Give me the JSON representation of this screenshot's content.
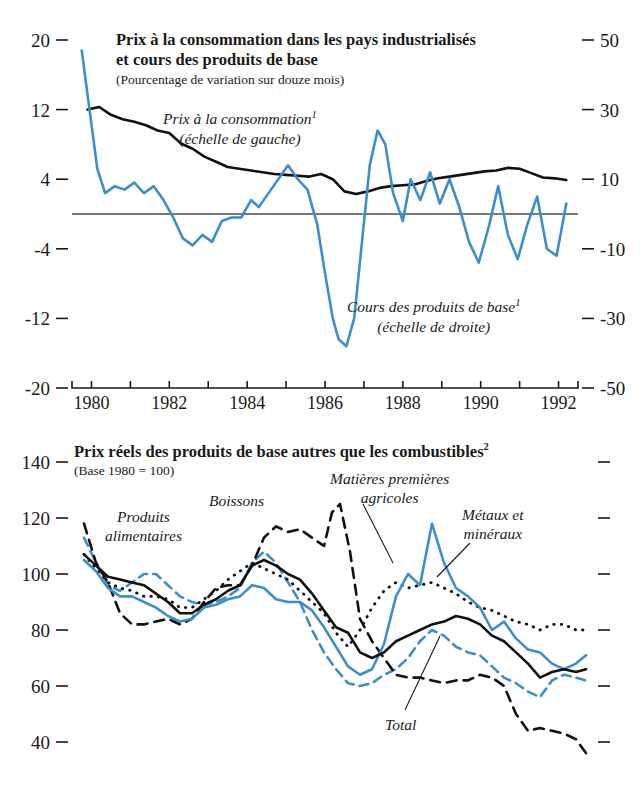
{
  "figure": {
    "language": "fr",
    "accent_blue": "#3d8fc9",
    "ink_black": "#111111"
  },
  "chart_data": [
    {
      "id": "top",
      "type": "line",
      "title": "Prix à la consommation dans les pays industrialisés et cours des produits de base",
      "title_line1": "Prix à la consommation dans les pays industrialisés",
      "title_line2": "et cours des produits de base",
      "subtitle": "(Pourcentage de variation sur douze mois)",
      "xlabel": "",
      "ylabel": "",
      "xlim": [
        1979.5,
        1992.5
      ],
      "xticks": [
        1980,
        1981,
        1982,
        1983,
        1984,
        1985,
        1986,
        1987,
        1988,
        1989,
        1990,
        1991,
        1992
      ],
      "xticklabels": [
        "1980",
        "",
        "1982",
        "",
        "1984",
        "",
        "1986",
        "",
        "1988",
        "",
        "1990",
        "",
        "1992"
      ],
      "left_axis": {
        "label": "échelle de gauche",
        "ylim": [
          -20,
          20
        ],
        "yticks": [
          20,
          12,
          4,
          -4,
          -12,
          -20
        ],
        "yticklabels": [
          "20",
          "12",
          "4",
          "-4",
          "-12",
          "-20"
        ]
      },
      "right_axis": {
        "label": "échelle de droite",
        "ylim": [
          -50,
          50
        ],
        "yticks": [
          50,
          30,
          10,
          -10,
          -30,
          -50
        ],
        "yticklabels": [
          "50",
          "30",
          "10",
          "-10",
          "-30",
          "-50"
        ]
      },
      "grid": false,
      "zero_line": true,
      "legend_position": "inline-annotations",
      "series": [
        {
          "name": "Prix à la consommation",
          "footnote_marker": "1",
          "axis": "left",
          "style": "solid",
          "color": "#111111",
          "label_line1": "Prix à la consommation",
          "label_line2": "(échelle de gauche)",
          "x": [
            1979.9,
            1980.2,
            1980.5,
            1980.8,
            1981.1,
            1981.4,
            1981.7,
            1982.0,
            1982.3,
            1982.6,
            1982.9,
            1983.2,
            1983.5,
            1983.8,
            1984.1,
            1984.4,
            1984.7,
            1985.0,
            1985.3,
            1985.6,
            1985.9,
            1986.2,
            1986.5,
            1986.8,
            1987.1,
            1987.4,
            1987.7,
            1988.0,
            1988.3,
            1988.6,
            1988.9,
            1989.2,
            1989.5,
            1989.8,
            1990.1,
            1990.4,
            1990.7,
            1991.0,
            1991.3,
            1991.6,
            1991.9,
            1992.2
          ],
          "y": [
            12.0,
            12.3,
            11.4,
            10.9,
            10.6,
            10.2,
            9.6,
            9.3,
            8.1,
            7.5,
            6.6,
            6.0,
            5.4,
            5.2,
            5.0,
            4.8,
            4.6,
            4.5,
            4.4,
            4.3,
            4.6,
            4.0,
            2.6,
            2.3,
            2.6,
            3.0,
            3.2,
            3.3,
            3.4,
            3.8,
            4.1,
            4.3,
            4.5,
            4.7,
            4.9,
            5.0,
            5.3,
            5.2,
            4.7,
            4.2,
            4.1,
            3.9
          ]
        },
        {
          "name": "Cours des produits de base",
          "footnote_marker": "1",
          "axis": "right",
          "style": "solid",
          "color": "#3d8fc9",
          "label_line1": "Cours des produits de base",
          "label_line2": "(échelle de droite)",
          "x": [
            1979.75,
            1979.95,
            1980.15,
            1980.35,
            1980.6,
            1980.85,
            1981.1,
            1981.35,
            1981.6,
            1981.85,
            1982.1,
            1982.35,
            1982.6,
            1982.85,
            1983.1,
            1983.35,
            1983.6,
            1983.85,
            1984.1,
            1984.3,
            1984.55,
            1984.8,
            1985.05,
            1985.3,
            1985.55,
            1985.8,
            1986.0,
            1986.2,
            1986.35,
            1986.55,
            1986.75,
            1986.95,
            1987.15,
            1987.35,
            1987.55,
            1987.75,
            1988.0,
            1988.2,
            1988.45,
            1988.7,
            1988.95,
            1989.2,
            1989.45,
            1989.7,
            1989.95,
            1990.2,
            1990.45,
            1990.7,
            1990.95,
            1991.2,
            1991.45,
            1991.7,
            1991.95,
            1992.2
          ],
          "y": [
            47,
            30,
            13,
            6,
            8,
            7,
            9,
            6,
            8,
            4,
            -1,
            -7,
            -9,
            -6,
            -8,
            -2,
            -1,
            -1,
            4,
            2,
            6,
            10,
            14,
            10,
            7,
            -3,
            -17,
            -30,
            -36,
            -38,
            -30,
            -8,
            14,
            24,
            20,
            6,
            -2,
            10,
            4,
            12,
            3,
            10,
            2,
            -8,
            -14,
            -4,
            8,
            -6,
            -13,
            -3,
            5,
            -10,
            -12,
            3,
            -9
          ]
        }
      ]
    },
    {
      "id": "bottom",
      "type": "line",
      "title": "Prix réels des produits de base autres que les combustibles",
      "title_footnote_marker": "2",
      "subtitle": "(Base 1980 = 100)",
      "xlabel": "",
      "ylabel": "",
      "xlim": [
        1979.5,
        1992.5
      ],
      "ylim": [
        30,
        145
      ],
      "yticks": [
        140,
        120,
        100,
        80,
        60,
        40
      ],
      "yticklabels": [
        "140",
        "120",
        "100",
        "80",
        "60",
        "40"
      ],
      "grid": false,
      "legend_position": "inline-annotations",
      "series": [
        {
          "name": "Produits alimentaires",
          "style": "dashed",
          "color": "#3d8fc9",
          "label_line1": "Produits",
          "label_line2": "alimentaires",
          "x": [
            1979.8,
            1980.1,
            1980.4,
            1980.7,
            1981.0,
            1981.3,
            1981.6,
            1981.9,
            1982.2,
            1982.5,
            1982.8,
            1983.1,
            1983.4,
            1983.7,
            1984.0,
            1984.3,
            1984.6,
            1984.9,
            1985.2,
            1985.5,
            1985.8,
            1986.1,
            1986.4,
            1986.7,
            1987.0,
            1987.3,
            1987.6,
            1987.9,
            1988.2,
            1988.5,
            1988.8,
            1989.1,
            1989.4,
            1989.7,
            1990.0,
            1990.3,
            1990.6,
            1990.9,
            1991.2,
            1991.5,
            1991.8,
            1992.1,
            1992.35
          ],
          "y": [
            113,
            104,
            96,
            94,
            97,
            100,
            100,
            96,
            92,
            90,
            89,
            90,
            92,
            95,
            104,
            108,
            104,
            97,
            90,
            80,
            72,
            66,
            61,
            60,
            61,
            64,
            66,
            70,
            76,
            80,
            78,
            74,
            72,
            71,
            67,
            63,
            61,
            58,
            56,
            62,
            64,
            63,
            62
          ]
        },
        {
          "name": "Boissons",
          "style": "dashed",
          "color": "#111111",
          "label_line1": "Boissons",
          "label_line2": "",
          "x": [
            1979.8,
            1980.1,
            1980.4,
            1980.7,
            1981.0,
            1981.3,
            1981.6,
            1981.9,
            1982.2,
            1982.5,
            1982.8,
            1983.1,
            1983.4,
            1983.7,
            1984.0,
            1984.3,
            1984.6,
            1984.9,
            1985.2,
            1985.5,
            1985.8,
            1986.0,
            1986.2,
            1986.45,
            1986.7,
            1987.0,
            1987.3,
            1987.6,
            1987.9,
            1988.2,
            1988.5,
            1988.8,
            1989.1,
            1989.4,
            1989.7,
            1990.0,
            1990.3,
            1990.6,
            1990.9,
            1991.2,
            1991.5,
            1991.8,
            1992.1,
            1992.35
          ],
          "y": [
            118,
            104,
            97,
            86,
            82,
            82,
            83,
            84,
            82,
            84,
            90,
            95,
            96,
            96,
            103,
            113,
            117,
            115,
            116,
            113,
            110,
            122,
            125,
            108,
            84,
            76,
            70,
            64,
            63,
            63,
            62,
            61,
            62,
            62,
            64,
            63,
            60,
            50,
            44,
            45,
            44,
            43,
            41,
            36
          ]
        },
        {
          "name": "Matières premières agricoles",
          "style": "dotted",
          "color": "#111111",
          "label_line1": "Matières premières",
          "label_line2": "agricoles",
          "x": [
            1979.8,
            1980.1,
            1980.4,
            1980.7,
            1981.0,
            1981.3,
            1981.6,
            1981.9,
            1982.2,
            1982.5,
            1982.8,
            1983.1,
            1983.4,
            1983.7,
            1984.0,
            1984.3,
            1984.6,
            1984.9,
            1985.2,
            1985.5,
            1985.8,
            1986.1,
            1986.4,
            1986.7,
            1987.0,
            1987.3,
            1987.6,
            1987.9,
            1988.2,
            1988.5,
            1988.8,
            1989.1,
            1989.4,
            1989.7,
            1990.0,
            1990.3,
            1990.6,
            1990.9,
            1991.2,
            1991.5,
            1991.8,
            1992.1,
            1992.35
          ],
          "y": [
            107,
            102,
            97,
            95,
            94,
            92,
            92,
            91,
            88,
            88,
            91,
            94,
            98,
            101,
            104,
            102,
            100,
            98,
            94,
            90,
            86,
            79,
            74,
            80,
            88,
            94,
            97,
            95,
            96,
            97,
            95,
            93,
            90,
            88,
            87,
            85,
            83,
            82,
            80,
            82,
            82,
            80,
            80
          ]
        },
        {
          "name": "Métaux et minéraux",
          "style": "solid",
          "color": "#3d8fc9",
          "label_line1": "Métaux et",
          "label_line2": "minéraux",
          "x": [
            1979.8,
            1980.1,
            1980.4,
            1980.7,
            1981.0,
            1981.3,
            1981.6,
            1981.9,
            1982.2,
            1982.5,
            1982.8,
            1983.1,
            1983.4,
            1983.7,
            1984.0,
            1984.3,
            1984.6,
            1984.9,
            1985.2,
            1985.5,
            1985.8,
            1986.1,
            1986.4,
            1986.7,
            1987.0,
            1987.3,
            1987.6,
            1987.9,
            1988.2,
            1988.5,
            1988.8,
            1989.1,
            1989.4,
            1989.7,
            1990.0,
            1990.3,
            1990.6,
            1990.9,
            1991.2,
            1991.5,
            1991.8,
            1992.1,
            1992.35
          ],
          "y": [
            105,
            101,
            95,
            92,
            92,
            90,
            88,
            85,
            83,
            84,
            88,
            89,
            91,
            92,
            96,
            95,
            91,
            90,
            90,
            87,
            81,
            74,
            67,
            64,
            66,
            75,
            92,
            100,
            96,
            118,
            104,
            95,
            92,
            88,
            80,
            83,
            77,
            73,
            72,
            68,
            66,
            68,
            71
          ]
        },
        {
          "name": "Total",
          "style": "solid",
          "color": "#111111",
          "label_line1": "Total",
          "label_line2": "",
          "x": [
            1979.8,
            1980.1,
            1980.4,
            1980.7,
            1981.0,
            1981.3,
            1981.6,
            1981.9,
            1982.2,
            1982.5,
            1982.8,
            1983.1,
            1983.4,
            1983.7,
            1984.0,
            1984.3,
            1984.6,
            1984.9,
            1985.2,
            1985.5,
            1985.8,
            1986.1,
            1986.4,
            1986.7,
            1987.0,
            1987.3,
            1987.6,
            1987.9,
            1988.2,
            1988.5,
            1988.8,
            1989.1,
            1989.4,
            1989.7,
            1990.0,
            1990.3,
            1990.6,
            1990.9,
            1991.2,
            1991.5,
            1991.8,
            1992.1,
            1992.35
          ],
          "y": [
            107,
            103,
            99,
            98,
            97,
            96,
            93,
            90,
            86,
            86,
            89,
            91,
            94,
            96,
            103,
            105,
            103,
            100,
            98,
            93,
            87,
            81,
            79,
            72,
            70,
            72,
            76,
            78,
            80,
            82,
            83,
            85,
            84,
            82,
            78,
            76,
            72,
            68,
            63,
            65,
            66,
            65,
            66
          ]
        }
      ]
    }
  ]
}
